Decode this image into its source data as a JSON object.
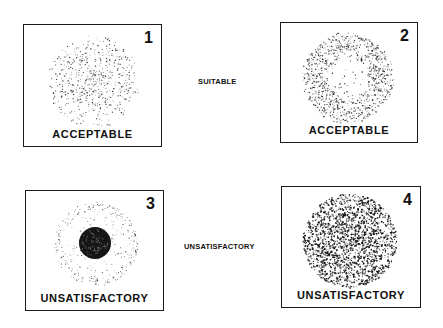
{
  "panels": [
    {
      "number": "1",
      "caption": "ACCEPTABLE",
      "pattern": "uniform-center-dense-spray"
    },
    {
      "number": "2",
      "caption": "ACCEPTABLE",
      "pattern": "ring-spray-light-center"
    },
    {
      "number": "3",
      "caption": "UNSATISFACTORY",
      "pattern": "dense-core-with-light-halo"
    },
    {
      "number": "4",
      "caption": "UNSATISFACTORY",
      "pattern": "uniformly-dense-spray"
    }
  ],
  "row_labels": {
    "top": "SUITABLE",
    "bottom": "UNSATISFACTORY"
  },
  "colors": {
    "ink": "#111111",
    "background": "#ffffff"
  }
}
